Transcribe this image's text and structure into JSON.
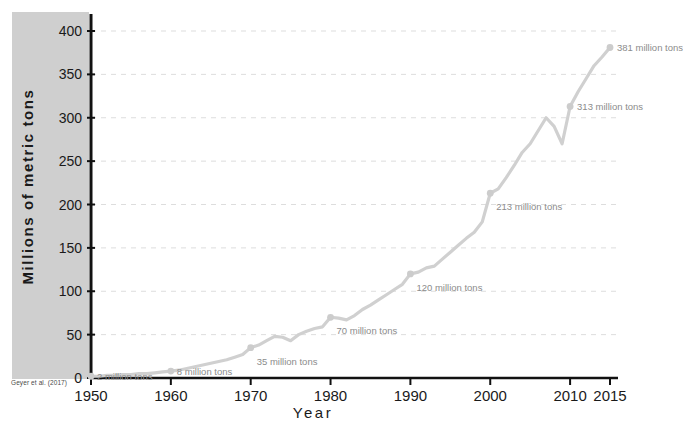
{
  "chart_data": {
    "type": "line",
    "title": "",
    "xlabel": "Year",
    "ylabel": "Millions of metric tons",
    "xlim": [
      1950,
      2016
    ],
    "ylim": [
      0,
      415
    ],
    "grid": true,
    "legend": null,
    "source": "Geyer et al. (2017)",
    "line_color": "#d0d0d0",
    "marker_color": "#cccccc",
    "label_color": "#8c8c8c",
    "axis_color": "#111111",
    "band_color": "#cfcfcf",
    "gridline_color": "#dddddd",
    "yticks": [
      0,
      50,
      100,
      150,
      200,
      250,
      300,
      350,
      400
    ],
    "ytick_labels": [
      "0",
      "50",
      "100",
      "150",
      "200",
      "250",
      "300",
      "350",
      "400"
    ],
    "xticks": [
      1950,
      1960,
      1970,
      1980,
      1990,
      2000,
      2010,
      2015
    ],
    "xtick_labels": [
      "1950",
      "1960",
      "1970",
      "1980",
      "1990",
      "2000",
      "2010",
      "2015"
    ],
    "x": [
      1950,
      1951,
      1952,
      1953,
      1954,
      1955,
      1956,
      1957,
      1958,
      1959,
      1960,
      1961,
      1962,
      1963,
      1964,
      1965,
      1966,
      1967,
      1968,
      1969,
      1970,
      1971,
      1972,
      1973,
      1974,
      1975,
      1976,
      1977,
      1978,
      1979,
      1980,
      1981,
      1982,
      1983,
      1984,
      1985,
      1986,
      1987,
      1988,
      1989,
      1990,
      1991,
      1992,
      1993,
      1994,
      1995,
      1996,
      1997,
      1998,
      1999,
      2000,
      2001,
      2002,
      2003,
      2004,
      2005,
      2006,
      2007,
      2008,
      2009,
      2010,
      2011,
      2012,
      2013,
      2014,
      2015
    ],
    "values": [
      2,
      2,
      3,
      3,
      4,
      4,
      5,
      5,
      6,
      7,
      8,
      9,
      11,
      13,
      15,
      17,
      19,
      21,
      24,
      27,
      35,
      38,
      43,
      48,
      47,
      43,
      50,
      54,
      57,
      59,
      70,
      69,
      67,
      72,
      79,
      84,
      90,
      96,
      102,
      108,
      120,
      122,
      127,
      129,
      137,
      145,
      153,
      161,
      168,
      180,
      213,
      218,
      231,
      245,
      260,
      270,
      285,
      300,
      290,
      270,
      313,
      330,
      345,
      360,
      370,
      381
    ],
    "annotated_points": [
      {
        "year": 1950,
        "value": 2,
        "label": "2 million tons",
        "dx": 6,
        "dy": 0
      },
      {
        "year": 1960,
        "value": 8,
        "label": "8 million tons",
        "dx": 6,
        "dy": 0
      },
      {
        "year": 1970,
        "value": 35,
        "label": "35 million tons",
        "dx": 6,
        "dy": 13
      },
      {
        "year": 1980,
        "value": 70,
        "label": "70 million tons",
        "dx": 6,
        "dy": 13
      },
      {
        "year": 1990,
        "value": 120,
        "label": "120 million tons",
        "dx": 6,
        "dy": 13
      },
      {
        "year": 2000,
        "value": 213,
        "label": "213 million tons",
        "dx": 6,
        "dy": 13
      },
      {
        "year": 2010,
        "value": 313,
        "label": "313 million tons",
        "dx": 7,
        "dy": 0
      },
      {
        "year": 2015,
        "value": 381,
        "label": "381 million tons",
        "dx": 7,
        "dy": 0
      }
    ]
  },
  "axis": {
    "y_title": "Millions of metric tons",
    "x_title": "Year"
  },
  "footer": {
    "source": "Geyer et al. (2017)"
  }
}
